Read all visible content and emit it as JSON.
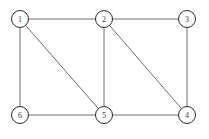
{
  "figure": {
    "title": "",
    "width": 209,
    "height": 139,
    "background_color": "#ffffff"
  },
  "chart_data": {
    "type": "diagram",
    "diagram_kind": "undirected-graph",
    "title": "",
    "xlabel": "",
    "ylabel": "",
    "grid": false,
    "legend": null,
    "node_style": {
      "shape": "circle",
      "radius": 8.5,
      "fill_color": "#ffffff",
      "stroke_color": "#2b2b2b",
      "stroke_width": 1,
      "label_color": "#3a3a3a",
      "label_font_size": 8
    },
    "edge_style": {
      "stroke_color": "#6e6e6e",
      "stroke_width": 1,
      "directed": false
    },
    "nodes": [
      {
        "id": "1",
        "label": "1",
        "x": 20,
        "y": 19
      },
      {
        "id": "2",
        "label": "2",
        "x": 104,
        "y": 19
      },
      {
        "id": "3",
        "label": "3",
        "x": 187,
        "y": 19
      },
      {
        "id": "4",
        "label": "4",
        "x": 187,
        "y": 115
      },
      {
        "id": "5",
        "label": "5",
        "x": 104,
        "y": 115
      },
      {
        "id": "6",
        "label": "6",
        "x": 20,
        "y": 115
      }
    ],
    "edges": [
      {
        "from": "1",
        "to": "2",
        "kind": "horizontal"
      },
      {
        "from": "2",
        "to": "3",
        "kind": "horizontal"
      },
      {
        "from": "1",
        "to": "6",
        "kind": "vertical"
      },
      {
        "from": "2",
        "to": "5",
        "kind": "vertical"
      },
      {
        "from": "3",
        "to": "4",
        "kind": "vertical"
      },
      {
        "from": "6",
        "to": "5",
        "kind": "horizontal"
      },
      {
        "from": "5",
        "to": "4",
        "kind": "horizontal"
      },
      {
        "from": "1",
        "to": "5",
        "kind": "diagonal"
      },
      {
        "from": "2",
        "to": "4",
        "kind": "diagonal"
      }
    ],
    "node_count": 6,
    "edge_count": 9
  }
}
